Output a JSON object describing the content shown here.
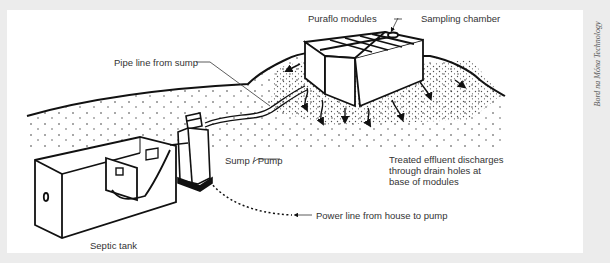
{
  "diagram": {
    "labels": {
      "puraflo_modules": "Puraflo modules",
      "sampling_chamber": "Sampling chamber",
      "pipe_line": "Pipe line from sump",
      "sump_pump": "Sump / Pump",
      "treated_effluent_line1": "Treated effluent discharges",
      "treated_effluent_line2": "through drain holes at",
      "treated_effluent_line3": "base of modules",
      "power_line": "Power line from house to pump",
      "septic_tank": "Septic tank"
    },
    "credit": "Bord na Móna Technology",
    "components": [
      "Septic tank",
      "Sump / Pump",
      "Pipe line from sump",
      "Puraflo modules",
      "Sampling chamber",
      "Power line from house to pump"
    ],
    "colors": {
      "background": "#ececec",
      "panel": "#ffffff",
      "ink": "#111111",
      "text": "#333333"
    }
  }
}
